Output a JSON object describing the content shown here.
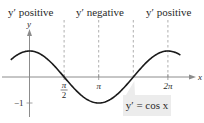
{
  "chart_data": {
    "type": "line",
    "title": "",
    "function": "y' = cos x",
    "xlabel": "x",
    "ylabel": "y",
    "xlim": [
      -0.85,
      6.85
    ],
    "ylim": [
      -1.5,
      1.6
    ],
    "grid": false,
    "series": [
      {
        "name": "y' = cos x",
        "expr": "cos",
        "x_range": [
          -0.85,
          6.85
        ]
      }
    ],
    "x_ticks": [
      {
        "value": 1.5708,
        "label_num": "π",
        "label_den": "2"
      },
      {
        "value": 3.1416,
        "label": "π"
      },
      {
        "value": 6.2832,
        "label": "2π"
      }
    ],
    "y_ticks": [
      {
        "value": -1,
        "label": "−1"
      }
    ],
    "dashed_guides": [
      1.5708,
      3.1416,
      4.7124,
      6.2832
    ],
    "region_labels": [
      {
        "text": "y′ positive",
        "region": "left"
      },
      {
        "text": "y′ negative",
        "region": "middle"
      },
      {
        "text": "y′ positive",
        "region": "right"
      }
    ],
    "callout": "y′ = cos x"
  },
  "colors": {
    "curve": "#1a1a1a",
    "axis": "#8c8c8c",
    "guide": "#9a9a9a",
    "callout_bg": "#ececec",
    "text": "#2a2a2a"
  }
}
